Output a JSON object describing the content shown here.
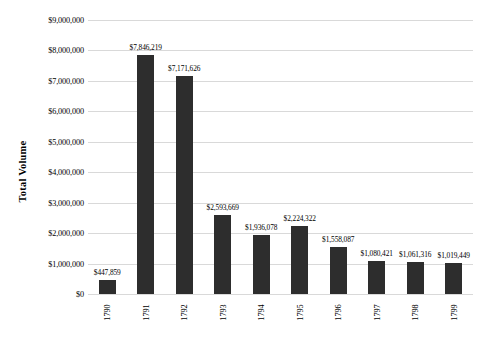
{
  "chart_data": {
    "type": "bar",
    "title": "",
    "xlabel": "",
    "ylabel": "Total Volume",
    "categories": [
      "1790",
      "1791",
      "1792",
      "1793",
      "1794",
      "1795",
      "1796",
      "1797",
      "1798",
      "1799"
    ],
    "values": [
      447859,
      7846219,
      7171626,
      2593669,
      1936078,
      2224322,
      1558087,
      1080421,
      1061316,
      1019449
    ],
    "data_labels": [
      "$447,859",
      "$7,846,219",
      "$7,171,626",
      "$2,593,669",
      "$1,936,078",
      "$2,224,322",
      "$1,558,087",
      "$1,080,421",
      "$1,061,316",
      "$1,019,449"
    ],
    "ylim": [
      0,
      9000000
    ],
    "ytick_values": [
      0,
      1000000,
      2000000,
      3000000,
      4000000,
      5000000,
      6000000,
      7000000,
      8000000,
      9000000
    ],
    "ytick_labels": [
      "$0",
      "$1,000,000",
      "$2,000,000",
      "$3,000,000",
      "$4,000,000",
      "$5,000,000",
      "$6,000,000",
      "$7,000,000",
      "$8,000,000",
      "$9,000,000"
    ],
    "grid": "horizontal",
    "legend": "none",
    "bar_color": "#2d2d2d",
    "gridline_color": "#d9d9d9",
    "background_color": "#ffffff",
    "xtick_rotation": -90
  }
}
